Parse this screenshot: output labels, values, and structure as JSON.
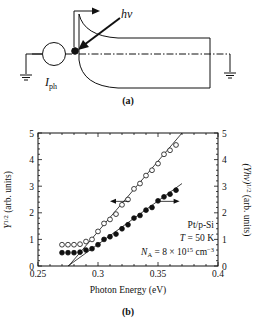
{
  "panel_a": {
    "label": "(a)",
    "photon_label": "hν",
    "current_label_main": "I",
    "current_label_sub": "ph"
  },
  "panel_b": {
    "label": "(b)",
    "xlabel": "Photon Energy (eV)",
    "ylabel_left": "Y^1/2 (arb. units)",
    "ylabel_left_main": "Y",
    "ylabel_left_sup": "1/2",
    "ylabel_left_rest": " (arb. units)",
    "ylabel_right_main": "(Yhν)",
    "ylabel_right_sup": "1/2",
    "ylabel_right_rest": " (arb. units)",
    "annotation_1": "Pt/p-Si",
    "annotation_2_italic": "T",
    "annotation_2_rest": " = 50 K",
    "annotation_3_main": "N",
    "annotation_3_sub": "A",
    "annotation_3_mid": " = 8 × 10",
    "annotation_3_sup": "15",
    "annotation_3_unit": " cm",
    "annotation_3_unitsup": "−3",
    "xticks": [
      "0.25",
      "0.3",
      "0.35",
      "0.4"
    ],
    "yticks_left": [
      "0",
      "1",
      "2",
      "3",
      "4",
      "5"
    ],
    "yticks_right": [
      "0",
      "1",
      "2",
      "3",
      "4",
      "5"
    ]
  },
  "chart_data": {
    "type": "scatter",
    "title": "",
    "xlabel": "Photon Energy (eV)",
    "ylabel": "Y^1/2 (arb. units)",
    "ylabel_right": "(Yhν)^1/2 (arb. units)",
    "xlim": [
      0.25,
      0.4
    ],
    "ylim": [
      0,
      5
    ],
    "ylim_right": [
      0,
      5
    ],
    "grid": false,
    "annotations": [
      "Pt/p-Si",
      "T = 50 K",
      "N_A = 8 × 10^15 cm^-3"
    ],
    "x": [
      0.27,
      0.275,
      0.28,
      0.285,
      0.29,
      0.295,
      0.3,
      0.305,
      0.31,
      0.315,
      0.32,
      0.325,
      0.33,
      0.335,
      0.34,
      0.345,
      0.35,
      0.355,
      0.36,
      0.365
    ],
    "series": [
      {
        "name": "Y^1/2 (open circles, left axis)",
        "marker": "open-circle",
        "axis": "left",
        "values": [
          0.8,
          0.8,
          0.8,
          0.82,
          0.92,
          1.0,
          1.3,
          1.6,
          1.75,
          1.95,
          2.3,
          2.5,
          2.9,
          3.1,
          3.4,
          3.6,
          3.85,
          4.2,
          4.35,
          4.55
        ],
        "fit_line": [
          [
            0.2755,
            0
          ],
          [
            0.37,
            5.0
          ]
        ]
      },
      {
        "name": "(Yhν)^1/2 (filled circles, right axis)",
        "marker": "filled-circle",
        "axis": "right",
        "values": [
          0.5,
          0.5,
          0.5,
          0.52,
          0.6,
          0.65,
          0.8,
          1.0,
          1.1,
          1.2,
          1.4,
          1.55,
          1.8,
          1.9,
          2.1,
          2.2,
          2.45,
          2.6,
          2.7,
          2.85
        ],
        "fit_line": [
          [
            0.275,
            0
          ],
          [
            0.37,
            3.1
          ]
        ]
      }
    ]
  }
}
